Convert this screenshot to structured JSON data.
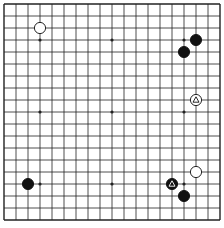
{
  "board": {
    "size": 19,
    "origin_x": 4,
    "origin_y": 4,
    "spacing": 12.0,
    "line_color": "#222222",
    "background": "#ffffff",
    "hoshi": [
      [
        3,
        3
      ],
      [
        9,
        3
      ],
      [
        15,
        3
      ],
      [
        3,
        9
      ],
      [
        9,
        9
      ],
      [
        15,
        9
      ],
      [
        3,
        15
      ],
      [
        9,
        15
      ],
      [
        15,
        15
      ]
    ],
    "stones": [
      {
        "color": "white",
        "col": 3,
        "row": 2,
        "marker": ""
      },
      {
        "color": "black",
        "col": 16,
        "row": 3,
        "marker": ""
      },
      {
        "color": "black",
        "col": 15,
        "row": 4,
        "marker": ""
      },
      {
        "color": "white",
        "col": 16,
        "row": 8,
        "marker": "triangle"
      },
      {
        "color": "white",
        "col": 16,
        "row": 14,
        "marker": ""
      },
      {
        "color": "black",
        "col": 14,
        "row": 15,
        "marker": "triangle"
      },
      {
        "color": "black",
        "col": 15,
        "row": 16,
        "marker": ""
      },
      {
        "color": "black",
        "col": 2,
        "row": 15,
        "marker": ""
      }
    ]
  }
}
